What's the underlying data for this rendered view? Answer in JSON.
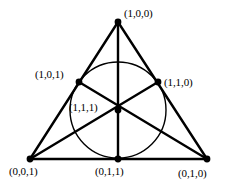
{
  "figure": {
    "background_color": "#ffffff",
    "stroke_color": "#000000",
    "point_color": "#000000"
  },
  "chart_data": {
    "type": "diagram",
    "xlabel": "",
    "ylabel": "",
    "xlim": [
      0,
      235
    ],
    "ylim": [
      0,
      186
    ],
    "grid": false,
    "legend": "none",
    "points": [
      {
        "id": "apex",
        "label": "(1,0,0)",
        "x": 118,
        "y": 22,
        "label_x": 124,
        "label_y": 8,
        "label_anchor": "left"
      },
      {
        "id": "mid-left",
        "label": "(1,0,1)",
        "x": 79,
        "y": 82,
        "label_x": 35,
        "label_y": 69,
        "label_anchor": "left"
      },
      {
        "id": "mid-right",
        "label": "(1,1,0)",
        "x": 158,
        "y": 82,
        "label_x": 164,
        "label_y": 77,
        "label_anchor": "left"
      },
      {
        "id": "center",
        "label": "(1,1,1)",
        "x": 118,
        "y": 110,
        "label_x": 69,
        "label_y": 102,
        "label_anchor": "left"
      },
      {
        "id": "bottom-left",
        "label": "(0,0,1)",
        "x": 30,
        "y": 159,
        "label_x": 9,
        "label_y": 166,
        "label_anchor": "left"
      },
      {
        "id": "bottom-mid",
        "label": "(0,1,1)",
        "x": 118,
        "y": 159,
        "label_x": 95,
        "label_y": 166,
        "label_anchor": "left"
      },
      {
        "id": "bottom-right",
        "label": "(0,1,0)",
        "x": 207,
        "y": 159,
        "label_x": 178,
        "label_y": 168,
        "label_anchor": "left"
      }
    ],
    "lines": [
      {
        "id": "side-left",
        "from": "apex",
        "to": "bottom-left",
        "width": 2.4
      },
      {
        "id": "side-right",
        "from": "apex",
        "to": "bottom-right",
        "width": 2.4
      },
      {
        "id": "side-bottom",
        "from": "bottom-left",
        "to": "bottom-right",
        "width": 2.4
      },
      {
        "id": "median-apex",
        "from": "apex",
        "to": "bottom-mid",
        "width": 2.4
      },
      {
        "id": "median-left",
        "from": "bottom-left",
        "to": "mid-right",
        "width": 2.4
      },
      {
        "id": "median-right",
        "from": "bottom-right",
        "to": "mid-left",
        "width": 2.4
      }
    ],
    "circles": [
      {
        "id": "incircle",
        "cx": 118,
        "cy": 110,
        "r": 48,
        "width": 1.4,
        "fill": "none"
      }
    ],
    "point_radius": 3.4
  }
}
